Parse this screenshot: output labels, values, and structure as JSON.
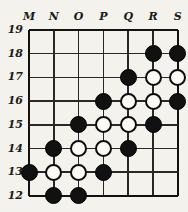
{
  "figure": {
    "kind": "go-board-diagram",
    "background_color": "#f4f2ec",
    "line_color": "#2a2724",
    "black_stone_color": "#111111",
    "white_stone_color": "#fbfaf7"
  },
  "axes": {
    "columns": [
      "M",
      "N",
      "O",
      "P",
      "Q",
      "R",
      "S"
    ],
    "rows": [
      "19",
      "18",
      "17",
      "16",
      "15",
      "14",
      "13",
      "12"
    ]
  },
  "geometry": {
    "origin_x": 29,
    "origin_y": 30,
    "step_x": 24.8,
    "step_y": 23.7,
    "stone_diameter": 17
  },
  "stones": [
    {
      "col": "R",
      "row": "18",
      "color": "black"
    },
    {
      "col": "S",
      "row": "18",
      "color": "black"
    },
    {
      "col": "Q",
      "row": "17",
      "color": "black"
    },
    {
      "col": "R",
      "row": "17",
      "color": "white"
    },
    {
      "col": "S",
      "row": "17",
      "color": "white"
    },
    {
      "col": "P",
      "row": "16",
      "color": "black"
    },
    {
      "col": "Q",
      "row": "16",
      "color": "white"
    },
    {
      "col": "R",
      "row": "16",
      "color": "white"
    },
    {
      "col": "S",
      "row": "16",
      "color": "black"
    },
    {
      "col": "O",
      "row": "15",
      "color": "black"
    },
    {
      "col": "P",
      "row": "15",
      "color": "white"
    },
    {
      "col": "Q",
      "row": "15",
      "color": "white"
    },
    {
      "col": "R",
      "row": "15",
      "color": "black"
    },
    {
      "col": "N",
      "row": "14",
      "color": "black"
    },
    {
      "col": "O",
      "row": "14",
      "color": "white"
    },
    {
      "col": "P",
      "row": "14",
      "color": "white"
    },
    {
      "col": "Q",
      "row": "14",
      "color": "black"
    },
    {
      "col": "M",
      "row": "13",
      "color": "black"
    },
    {
      "col": "N",
      "row": "13",
      "color": "white"
    },
    {
      "col": "O",
      "row": "13",
      "color": "white"
    },
    {
      "col": "P",
      "row": "13",
      "color": "black"
    },
    {
      "col": "N",
      "row": "12",
      "color": "black"
    },
    {
      "col": "O",
      "row": "12",
      "color": "black"
    }
  ]
}
